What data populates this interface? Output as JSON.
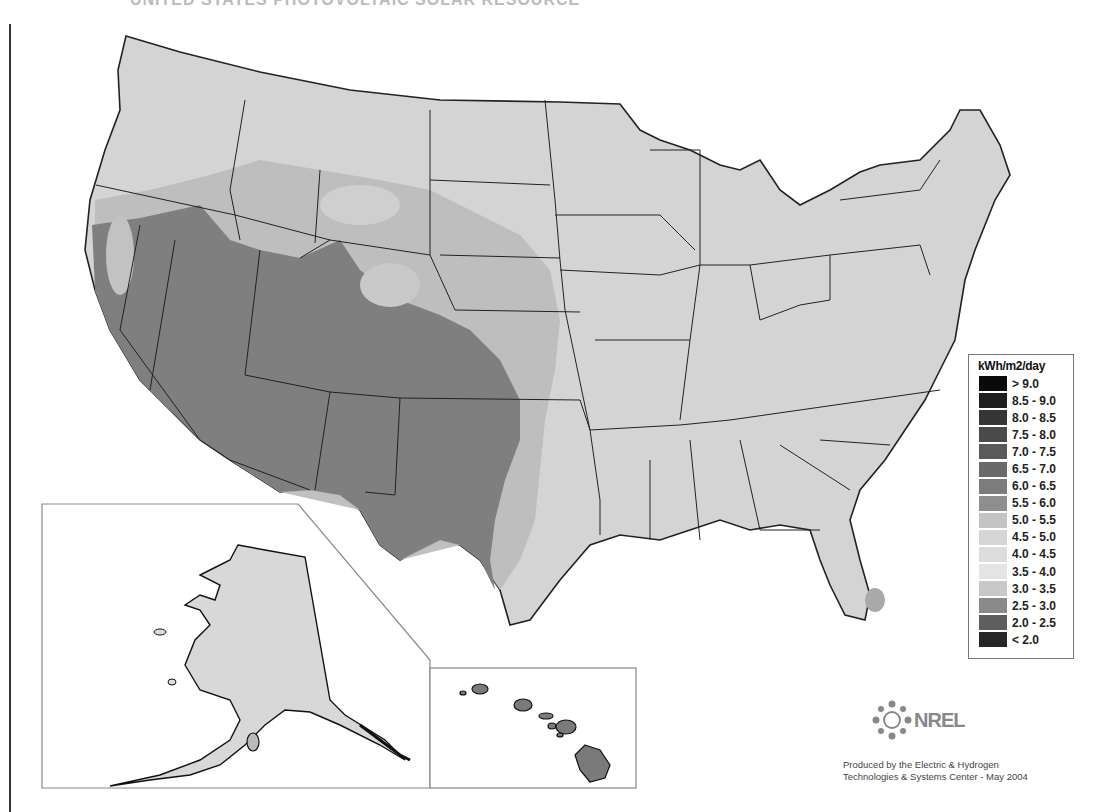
{
  "title": "UNITED STATES PHOTOVOLTAIC SOLAR RESOURCE",
  "legend": {
    "title": "kWh/m2/day",
    "items": [
      {
        "label": "> 9.0",
        "color": "#0a0a0a"
      },
      {
        "label": "8.5 - 9.0",
        "color": "#1e1e1e"
      },
      {
        "label": "8.0 - 8.5",
        "color": "#363636"
      },
      {
        "label": "7.5 - 8.0",
        "color": "#4a4a4a"
      },
      {
        "label": "7.0 - 7.5",
        "color": "#5a5a5a"
      },
      {
        "label": "6.5 - 7.0",
        "color": "#6a6a6a"
      },
      {
        "label": "6.0 - 6.5",
        "color": "#7c7c7c"
      },
      {
        "label": "5.5 - 6.0",
        "color": "#8e8e8e"
      },
      {
        "label": "5.0 - 5.5",
        "color": "#c4c4c4"
      },
      {
        "label": "4.5 - 5.0",
        "color": "#d6d6d6"
      },
      {
        "label": "4.0 - 4.5",
        "color": "#dcdcdc"
      },
      {
        "label": "3.5 - 4.0",
        "color": "#e4e4e4"
      },
      {
        "label": "3.0 - 3.5",
        "color": "#c8c8c8"
      },
      {
        "label": "2.5 - 3.0",
        "color": "#8a8a8a"
      },
      {
        "label": "2.0 - 2.5",
        "color": "#5e5e5e"
      },
      {
        "label": "< 2.0",
        "color": "#262626"
      }
    ]
  },
  "regions": {
    "southwest": {
      "name": "Southwest (CA, NV, AZ, UT, NM, CO, W. TX)",
      "range": "6.0 - 7.0",
      "color": "#7f7f7f"
    },
    "plains": {
      "name": "Great Plains / Intermountain",
      "range": "5.0 - 5.5",
      "color": "#bdbdbd"
    },
    "east": {
      "name": "Eastern US",
      "range": "4.0 - 5.0",
      "color": "#d4d4d4"
    },
    "alaska": {
      "name": "Alaska",
      "range": "3.0 - 4.0",
      "color": "#d8d8d8"
    },
    "hawaii": {
      "name": "Hawaii",
      "range": "6.0 - 6.5",
      "color": "#7a7a7a"
    }
  },
  "insets": {
    "alaska_label": "Alaska inset",
    "hawaii_label": "Hawaii inset"
  },
  "logo": {
    "text": "NREL"
  },
  "credit": {
    "line1": "Produced by the Electric & Hydrogen",
    "line2": "Technologies & Systems Center - May 2004"
  }
}
